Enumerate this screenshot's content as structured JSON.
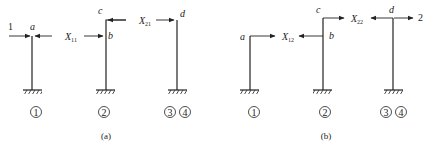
{
  "panels": [
    {
      "id": "a",
      "caption": "(a)",
      "load_label": "1",
      "nodes": {
        "a": "a",
        "b": "b",
        "c": "c",
        "d": "d"
      },
      "unknowns": [
        {
          "base": "X",
          "sub": "11"
        },
        {
          "base": "X",
          "sub": "21"
        }
      ],
      "members": [
        "1",
        "2",
        "3",
        "4"
      ]
    },
    {
      "id": "b",
      "caption": "(b)",
      "load_label": "2",
      "nodes": {
        "a": "a",
        "b": "b",
        "c": "c",
        "d": "d"
      },
      "unknowns": [
        {
          "base": "X",
          "sub": "12"
        },
        {
          "base": "X",
          "sub": "22"
        }
      ],
      "members": [
        "1",
        "2",
        "3",
        "4"
      ]
    }
  ]
}
